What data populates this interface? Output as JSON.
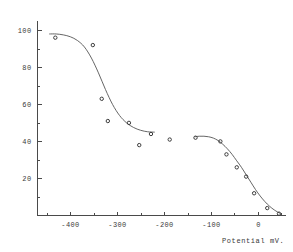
{
  "chart_data": {
    "type": "scatter",
    "title": "",
    "subtitle": "",
    "xlabel": "Potential mV.",
    "ylabel": "",
    "xlim": [
      -470,
      60
    ],
    "ylim": [
      0,
      105
    ],
    "xticks": [
      -400,
      -300,
      -200,
      -100,
      0
    ],
    "xtick_labels": [
      "-400",
      "-300",
      "-200",
      "-100",
      "0"
    ],
    "yticks": [
      20,
      40,
      60,
      80,
      100
    ],
    "ytick_labels": [
      "20",
      "40",
      "60",
      "80",
      "100"
    ],
    "minor_xticks": [
      -450,
      -350,
      -250,
      -150,
      -50,
      50
    ],
    "minor_yticks": [
      10,
      30,
      50,
      70,
      90
    ],
    "grid": false,
    "legend": false,
    "legend_position": "none",
    "marker": "open-circle",
    "points": [
      {
        "x": -432,
        "y": 96
      },
      {
        "x": -352,
        "y": 92
      },
      {
        "x": -333,
        "y": 63
      },
      {
        "x": -320,
        "y": 51
      },
      {
        "x": -275,
        "y": 50
      },
      {
        "x": -253,
        "y": 38
      },
      {
        "x": -228,
        "y": 44
      },
      {
        "x": -188,
        "y": 41
      },
      {
        "x": -133,
        "y": 42
      },
      {
        "x": -80,
        "y": 40
      },
      {
        "x": -67,
        "y": 33
      },
      {
        "x": -45,
        "y": 26
      },
      {
        "x": -25,
        "y": 21
      },
      {
        "x": -8,
        "y": 12
      },
      {
        "x": 20,
        "y": 4
      },
      {
        "x": 45,
        "y": 1
      }
    ],
    "series": [
      {
        "name": "fitted-curve-left",
        "comment": "upper sigmoid branch from -445 to -215",
        "x": [
          -445,
          -430,
          -415,
          -400,
          -385,
          -370,
          -355,
          -340,
          -325,
          -310,
          -295,
          -280,
          -265,
          -250,
          -235,
          -220
        ],
        "y": [
          98,
          98,
          97.5,
          96.5,
          94.5,
          91,
          85,
          77,
          68,
          60,
          54,
          50,
          47.5,
          46,
          45.2,
          45
        ]
      },
      {
        "name": "fitted-curve-right",
        "comment": "lower sigmoid branch from -135 to 48",
        "x": [
          -135,
          -125,
          -115,
          -105,
          -95,
          -85,
          -75,
          -65,
          -55,
          -45,
          -35,
          -25,
          -15,
          -5,
          5,
          15,
          25,
          35,
          48
        ],
        "y": [
          42.5,
          42.8,
          42.8,
          42.5,
          41.8,
          40.5,
          38.5,
          36,
          33,
          29.5,
          26,
          22,
          18,
          14,
          10.5,
          7.5,
          5,
          3,
          1
        ]
      }
    ]
  },
  "figure": {
    "axis_color": "#4a4a4a",
    "marker_color": "#3d3d3d",
    "curve_color": "#555555",
    "text_color": "#3a3a3a",
    "background": "#ffffff"
  }
}
